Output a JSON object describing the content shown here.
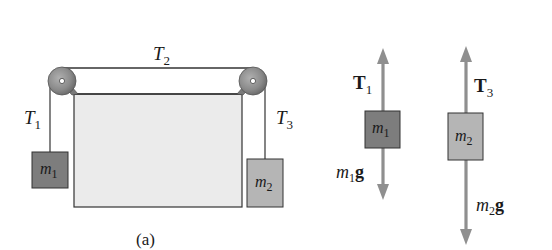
{
  "figure": {
    "caption": "(a)",
    "colors": {
      "background": "#ffffff",
      "table_fill": "#ebebeb",
      "table_edge": "#333333",
      "rope": "#333333",
      "pulley": "#8a8a8a",
      "pulley_dark": "#5e5e5e",
      "block_m1": "#7d7d7d",
      "block_m2": "#b5b5b5",
      "arrow": "#8f8f8f"
    }
  },
  "setup": {
    "tension_top": {
      "symbol": "T",
      "subscript": "2"
    },
    "tension_left": {
      "symbol": "T",
      "subscript": "1"
    },
    "tension_right": {
      "symbol": "T",
      "subscript": "3"
    },
    "block_left": {
      "symbol": "m",
      "subscript": "1"
    },
    "block_right": {
      "symbol": "m",
      "subscript": "2"
    }
  },
  "free_body_diagrams": [
    {
      "block": {
        "symbol": "m",
        "subscript": "1"
      },
      "up_force": {
        "symbol": "T",
        "subscript": "1"
      },
      "down_force": {
        "symbol": "m",
        "subscript": "1",
        "suffix": "g"
      }
    },
    {
      "block": {
        "symbol": "m",
        "subscript": "2"
      },
      "up_force": {
        "symbol": "T",
        "subscript": "3"
      },
      "down_force": {
        "symbol": "m",
        "subscript": "2",
        "suffix": "g"
      }
    }
  ]
}
